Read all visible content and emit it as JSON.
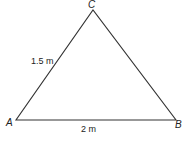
{
  "diagram": {
    "type": "triangle",
    "vertices": {
      "A": {
        "label": "A",
        "x": 16,
        "y": 120
      },
      "B": {
        "label": "B",
        "x": 176,
        "y": 120
      },
      "C": {
        "label": "C",
        "x": 93,
        "y": 10
      }
    },
    "edges": {
      "AC": {
        "label": "1.5 m"
      },
      "AB": {
        "label": "2 m"
      }
    },
    "stroke_color": "#333333"
  }
}
